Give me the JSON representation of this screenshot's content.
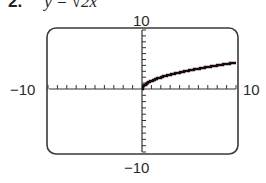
{
  "problem": {
    "number": "2.",
    "equation": "y = √2x"
  },
  "labels": {
    "ymax": "10",
    "ymin": "−10",
    "xmin": "−10",
    "xmax": "10"
  },
  "chart_data": {
    "type": "line",
    "xlabel": "",
    "ylabel": "",
    "xlim": [
      -10,
      10
    ],
    "ylim": [
      -10,
      10
    ],
    "x_ticks_step": 1,
    "y_ticks_step": 1,
    "grid": false,
    "series": [
      {
        "name": "y = sqrt(2x)",
        "color": "#1a0a10",
        "x": [
          0,
          0.5,
          1,
          2,
          3,
          4,
          5,
          6,
          7,
          8,
          9,
          10
        ],
        "y": [
          0,
          1,
          1.41,
          2,
          2.45,
          2.83,
          3.16,
          3.46,
          3.74,
          4,
          4.24,
          4.47
        ]
      }
    ]
  }
}
